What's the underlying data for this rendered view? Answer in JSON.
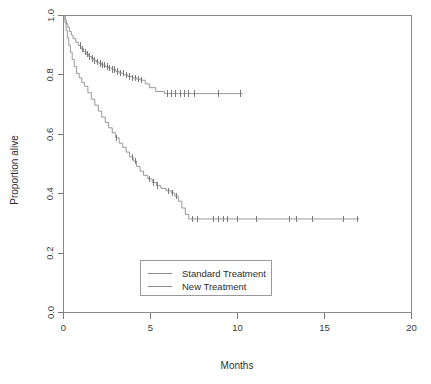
{
  "chart_data": {
    "type": "line",
    "subtype": "kaplan-meier-survival",
    "title": "",
    "xlabel": "Months",
    "ylabel": "Proportion alive",
    "xlim": [
      0,
      20
    ],
    "ylim": [
      0.0,
      1.0
    ],
    "xticks": [
      0,
      5,
      10,
      15,
      20
    ],
    "xticklabels": [
      "0",
      "5",
      "10",
      "15",
      "20"
    ],
    "yticks": [
      0.0,
      0.2,
      0.4,
      0.6,
      0.8,
      1.0
    ],
    "yticklabels": [
      "0.0",
      "0.2",
      "0.4",
      "0.6",
      "0.8",
      "1.0"
    ],
    "grid": false,
    "legend_position": "lower center",
    "line_color": "#8d8d8d",
    "censor_color": "#6f6f6f",
    "series": [
      {
        "name": "Standard Treatment",
        "color": "#8d8d8d",
        "steps": [
          [
            0.0,
            1.0
          ],
          [
            0.1,
            0.985
          ],
          [
            0.18,
            0.972
          ],
          [
            0.25,
            0.96
          ],
          [
            0.35,
            0.946
          ],
          [
            0.45,
            0.934
          ],
          [
            0.55,
            0.922
          ],
          [
            0.7,
            0.91
          ],
          [
            0.85,
            0.899
          ],
          [
            1.0,
            0.888
          ],
          [
            1.15,
            0.878
          ],
          [
            1.3,
            0.87
          ],
          [
            1.45,
            0.862
          ],
          [
            1.6,
            0.855
          ],
          [
            1.75,
            0.849
          ],
          [
            1.9,
            0.843
          ],
          [
            2.05,
            0.838
          ],
          [
            2.2,
            0.833
          ],
          [
            2.4,
            0.828
          ],
          [
            2.6,
            0.823
          ],
          [
            2.8,
            0.818
          ],
          [
            3.0,
            0.812
          ],
          [
            3.2,
            0.806
          ],
          [
            3.45,
            0.8
          ],
          [
            3.7,
            0.795
          ],
          [
            3.95,
            0.79
          ],
          [
            4.2,
            0.786
          ],
          [
            4.45,
            0.782
          ],
          [
            4.7,
            0.77
          ],
          [
            4.95,
            0.757
          ],
          [
            5.3,
            0.744
          ],
          [
            5.8,
            0.737
          ],
          [
            10.3,
            0.737
          ]
        ],
        "censor_times": [
          0.95,
          1.1,
          1.25,
          1.38,
          1.52,
          1.66,
          1.8,
          1.95,
          2.1,
          2.25,
          2.38,
          2.52,
          2.66,
          2.8,
          2.95,
          3.1,
          3.25,
          3.42,
          3.6,
          3.78,
          3.95,
          4.12,
          4.3,
          4.5,
          5.95,
          6.2,
          6.45,
          6.7,
          6.95,
          7.2,
          7.5,
          8.9,
          10.2
        ],
        "final_proportion": 0.737,
        "max_followup_months": 10.3
      },
      {
        "name": "New Treatment",
        "color": "#8d8d8d",
        "steps": [
          [
            0.0,
            1.0
          ],
          [
            0.08,
            0.975
          ],
          [
            0.15,
            0.95
          ],
          [
            0.22,
            0.925
          ],
          [
            0.3,
            0.9
          ],
          [
            0.4,
            0.876
          ],
          [
            0.5,
            0.852
          ],
          [
            0.62,
            0.828
          ],
          [
            0.75,
            0.805
          ],
          [
            0.9,
            0.79
          ],
          [
            1.05,
            0.775
          ],
          [
            1.2,
            0.762
          ],
          [
            1.4,
            0.74
          ],
          [
            1.6,
            0.718
          ],
          [
            1.8,
            0.698
          ],
          [
            2.0,
            0.678
          ],
          [
            2.2,
            0.658
          ],
          [
            2.4,
            0.64
          ],
          [
            2.6,
            0.622
          ],
          [
            2.8,
            0.605
          ],
          [
            3.0,
            0.588
          ],
          [
            3.2,
            0.57
          ],
          [
            3.4,
            0.556
          ],
          [
            3.6,
            0.54
          ],
          [
            3.8,
            0.524
          ],
          [
            4.0,
            0.51
          ],
          [
            4.2,
            0.492
          ],
          [
            4.4,
            0.476
          ],
          [
            4.6,
            0.462
          ],
          [
            4.85,
            0.45
          ],
          [
            5.1,
            0.438
          ],
          [
            5.35,
            0.427
          ],
          [
            5.6,
            0.418
          ],
          [
            5.9,
            0.41
          ],
          [
            6.2,
            0.402
          ],
          [
            6.4,
            0.392
          ],
          [
            6.6,
            0.375
          ],
          [
            6.8,
            0.352
          ],
          [
            7.0,
            0.33
          ],
          [
            7.2,
            0.315
          ],
          [
            17.0,
            0.315
          ]
        ],
        "censor_times": [
          3.05,
          3.95,
          4.15,
          4.95,
          5.15,
          5.4,
          6.05,
          6.25,
          6.5,
          7.4,
          7.7,
          8.6,
          8.9,
          9.2,
          9.4,
          10.0,
          11.1,
          13.0,
          13.4,
          14.3,
          16.1,
          16.9
        ],
        "final_proportion": 0.315,
        "max_followup_months": 17.0
      }
    ],
    "legend": [
      {
        "label": "Standard Treatment",
        "color": "#8d8d8d"
      },
      {
        "label": "New Treatment",
        "color": "#8d8d8d"
      }
    ]
  }
}
